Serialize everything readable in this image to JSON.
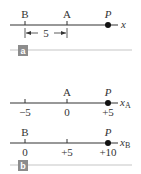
{
  "panel_a": {
    "tag": "a",
    "axis_label": "x",
    "points": [
      {
        "name": "B",
        "x": 25
      },
      {
        "name": "A",
        "x": 67
      }
    ],
    "particle": {
      "name": "P",
      "x": 108
    },
    "distance_label": "5"
  },
  "panel_b": {
    "tag": "b",
    "axis_A": {
      "axis_label": "x",
      "axis_sub": "A",
      "origin_label": "A",
      "particle": "P",
      "ticks": [
        "−5",
        "0",
        "+5"
      ]
    },
    "axis_B": {
      "axis_label": "x",
      "axis_sub": "B",
      "origin_label": "B",
      "particle": "P",
      "ticks": [
        "0",
        "+5",
        "+10"
      ]
    }
  },
  "colors": {
    "axis": "#333333",
    "tag_bg": "#8c8c8c",
    "divider": "#d9d9d9"
  }
}
